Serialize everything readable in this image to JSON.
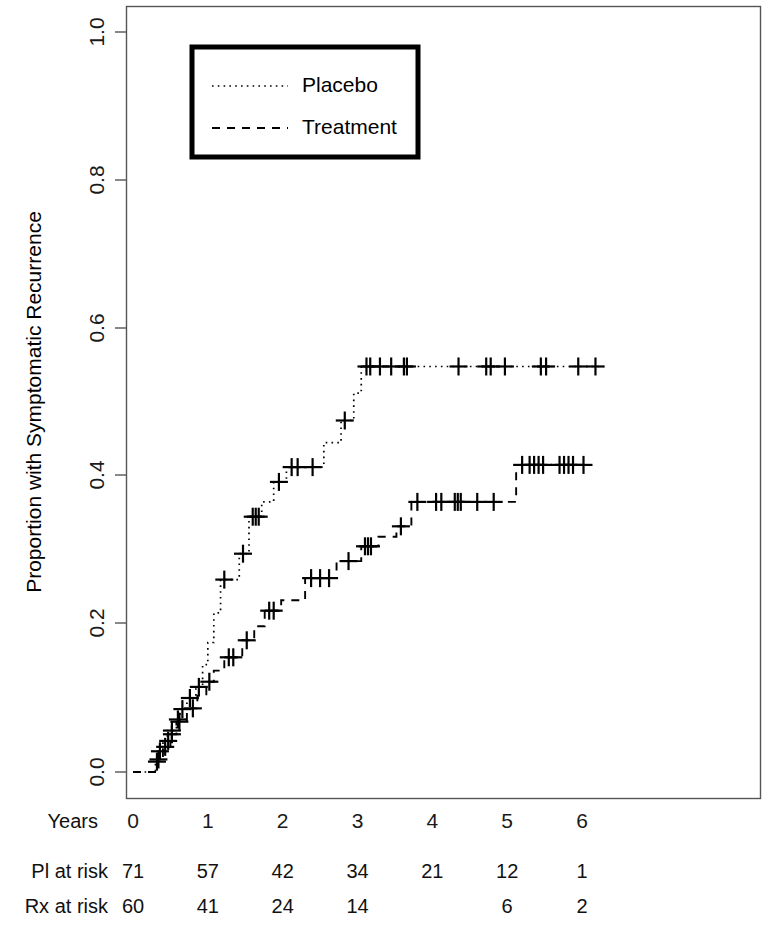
{
  "chart_data": {
    "type": "line",
    "title": "",
    "subtitle": "",
    "xlabel": "Years",
    "ylabel": "Proportion with Symptomatic Recurrence",
    "xlim": [
      -0.12,
      6.6
    ],
    "ylim": [
      0.0,
      1.0
    ],
    "grid": false,
    "legend_position": "top-left",
    "x_ticks": [
      0,
      1,
      2,
      3,
      4,
      5,
      6
    ],
    "x_tick_labels": [
      "0",
      "1",
      "2",
      "3",
      "4",
      "5",
      "6"
    ],
    "y_ticks": [
      0.0,
      0.2,
      0.4,
      0.6,
      0.8,
      1.0
    ],
    "y_tick_labels": [
      "0.0",
      "0.2",
      "0.4",
      "0.6",
      "0.8",
      "1.0"
    ],
    "series": [
      {
        "name": "Placebo",
        "linestyle": "dotted",
        "color": "#000000",
        "steps": [
          [
            0.0,
            0.0
          ],
          [
            0.3,
            0.0
          ],
          [
            0.3,
            0.014
          ],
          [
            0.35,
            0.014
          ],
          [
            0.35,
            0.028
          ],
          [
            0.4,
            0.028
          ],
          [
            0.4,
            0.042
          ],
          [
            0.46,
            0.042
          ],
          [
            0.46,
            0.056
          ],
          [
            0.58,
            0.056
          ],
          [
            0.58,
            0.071
          ],
          [
            0.63,
            0.071
          ],
          [
            0.63,
            0.085
          ],
          [
            0.72,
            0.085
          ],
          [
            0.72,
            0.1
          ],
          [
            0.84,
            0.1
          ],
          [
            0.84,
            0.115
          ],
          [
            0.93,
            0.115
          ],
          [
            0.93,
            0.145
          ],
          [
            1.0,
            0.145
          ],
          [
            1.0,
            0.175
          ],
          [
            1.08,
            0.175
          ],
          [
            1.08,
            0.215
          ],
          [
            1.17,
            0.215
          ],
          [
            1.17,
            0.26
          ],
          [
            1.42,
            0.26
          ],
          [
            1.42,
            0.295
          ],
          [
            1.55,
            0.295
          ],
          [
            1.55,
            0.345
          ],
          [
            1.72,
            0.345
          ],
          [
            1.72,
            0.365
          ],
          [
            1.88,
            0.365
          ],
          [
            1.88,
            0.392
          ],
          [
            2.05,
            0.392
          ],
          [
            2.05,
            0.412
          ],
          [
            2.55,
            0.412
          ],
          [
            2.55,
            0.445
          ],
          [
            2.78,
            0.445
          ],
          [
            2.78,
            0.475
          ],
          [
            2.95,
            0.475
          ],
          [
            2.95,
            0.512
          ],
          [
            3.05,
            0.512
          ],
          [
            3.05,
            0.548
          ],
          [
            6.3,
            0.548
          ]
        ],
        "censor_points": [
          [
            0.32,
            0.014
          ],
          [
            0.36,
            0.028
          ],
          [
            0.47,
            0.042
          ],
          [
            0.52,
            0.056
          ],
          [
            0.6,
            0.071
          ],
          [
            0.66,
            0.085
          ],
          [
            0.76,
            0.1
          ],
          [
            0.88,
            0.115
          ],
          [
            1.22,
            0.26
          ],
          [
            1.47,
            0.295
          ],
          [
            1.6,
            0.345
          ],
          [
            1.64,
            0.345
          ],
          [
            1.68,
            0.345
          ],
          [
            1.95,
            0.392
          ],
          [
            2.12,
            0.412
          ],
          [
            2.2,
            0.412
          ],
          [
            2.4,
            0.412
          ],
          [
            2.83,
            0.475
          ],
          [
            3.12,
            0.548
          ],
          [
            3.17,
            0.548
          ],
          [
            3.3,
            0.548
          ],
          [
            3.45,
            0.548
          ],
          [
            3.62,
            0.548
          ],
          [
            3.66,
            0.548
          ],
          [
            4.35,
            0.548
          ],
          [
            4.72,
            0.548
          ],
          [
            4.78,
            0.548
          ],
          [
            4.97,
            0.548
          ],
          [
            5.45,
            0.548
          ],
          [
            5.52,
            0.548
          ],
          [
            5.95,
            0.548
          ],
          [
            6.18,
            0.548
          ]
        ]
      },
      {
        "name": "Treatment",
        "linestyle": "dashed",
        "color": "#000000",
        "steps": [
          [
            0.0,
            0.0
          ],
          [
            0.32,
            0.0
          ],
          [
            0.32,
            0.017
          ],
          [
            0.4,
            0.017
          ],
          [
            0.4,
            0.034
          ],
          [
            0.5,
            0.034
          ],
          [
            0.5,
            0.051
          ],
          [
            0.58,
            0.051
          ],
          [
            0.58,
            0.068
          ],
          [
            0.72,
            0.068
          ],
          [
            0.72,
            0.086
          ],
          [
            0.86,
            0.086
          ],
          [
            0.86,
            0.103
          ],
          [
            0.98,
            0.103
          ],
          [
            0.98,
            0.122
          ],
          [
            1.08,
            0.122
          ],
          [
            1.08,
            0.137
          ],
          [
            1.22,
            0.137
          ],
          [
            1.22,
            0.155
          ],
          [
            1.46,
            0.155
          ],
          [
            1.46,
            0.178
          ],
          [
            1.62,
            0.178
          ],
          [
            1.62,
            0.197
          ],
          [
            1.76,
            0.197
          ],
          [
            1.76,
            0.218
          ],
          [
            1.98,
            0.218
          ],
          [
            1.98,
            0.232
          ],
          [
            2.3,
            0.232
          ],
          [
            2.3,
            0.262
          ],
          [
            2.72,
            0.262
          ],
          [
            2.72,
            0.285
          ],
          [
            3.05,
            0.285
          ],
          [
            3.05,
            0.305
          ],
          [
            3.28,
            0.305
          ],
          [
            3.28,
            0.318
          ],
          [
            3.52,
            0.318
          ],
          [
            3.52,
            0.332
          ],
          [
            3.72,
            0.332
          ],
          [
            3.72,
            0.365
          ],
          [
            5.12,
            0.365
          ],
          [
            5.12,
            0.415
          ],
          [
            6.05,
            0.415
          ]
        ],
        "censor_points": [
          [
            0.34,
            0.017
          ],
          [
            0.43,
            0.034
          ],
          [
            0.52,
            0.051
          ],
          [
            0.62,
            0.068
          ],
          [
            0.8,
            0.086
          ],
          [
            1.02,
            0.122
          ],
          [
            1.28,
            0.155
          ],
          [
            1.34,
            0.155
          ],
          [
            1.52,
            0.178
          ],
          [
            1.82,
            0.218
          ],
          [
            1.88,
            0.218
          ],
          [
            2.38,
            0.262
          ],
          [
            2.5,
            0.262
          ],
          [
            2.62,
            0.262
          ],
          [
            2.88,
            0.285
          ],
          [
            3.1,
            0.305
          ],
          [
            3.14,
            0.305
          ],
          [
            3.18,
            0.305
          ],
          [
            3.58,
            0.332
          ],
          [
            3.8,
            0.365
          ],
          [
            4.05,
            0.365
          ],
          [
            4.12,
            0.365
          ],
          [
            4.3,
            0.365
          ],
          [
            4.34,
            0.365
          ],
          [
            4.38,
            0.365
          ],
          [
            4.6,
            0.365
          ],
          [
            4.82,
            0.365
          ],
          [
            5.2,
            0.415
          ],
          [
            5.3,
            0.415
          ],
          [
            5.36,
            0.415
          ],
          [
            5.42,
            0.415
          ],
          [
            5.48,
            0.415
          ],
          [
            5.7,
            0.415
          ],
          [
            5.76,
            0.415
          ],
          [
            5.82,
            0.415
          ],
          [
            5.88,
            0.415
          ],
          [
            6.02,
            0.415
          ]
        ]
      }
    ]
  },
  "legend": {
    "entries": [
      {
        "label": "Placebo",
        "style": "dotted"
      },
      {
        "label": "Treatment",
        "style": "dashed"
      }
    ]
  },
  "risk_table": {
    "row_label_years": "Years",
    "years": [
      "0",
      "1",
      "2",
      "3",
      "4",
      "5",
      "6"
    ],
    "rows": [
      {
        "label": "Pl at risk",
        "values": [
          "71",
          "57",
          "42",
          "34",
          "21",
          "12",
          "1"
        ]
      },
      {
        "label": "Rx at risk",
        "values": [
          "60",
          "41",
          "24",
          "14",
          "",
          "6",
          "2"
        ]
      }
    ]
  },
  "axes": {
    "y_title": "Proportion with Symptomatic Recurrence",
    "y_tick_labels": [
      "0.0",
      "0.2",
      "0.4",
      "0.6",
      "0.8",
      "1.0"
    ],
    "x_tick_labels": [
      "0",
      "1",
      "2",
      "3",
      "4",
      "5",
      "6"
    ]
  },
  "colors": {
    "ink": "#000000",
    "frame": "#555555",
    "background": "#ffffff"
  }
}
